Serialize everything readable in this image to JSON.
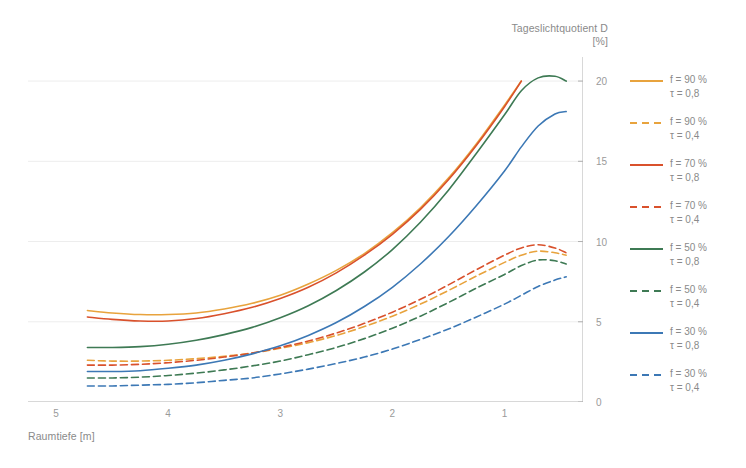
{
  "chart_data": {
    "type": "line",
    "title": "Tageslichtquotient D",
    "title_unit": "[%]",
    "xlabel": "Raumtiefe [m]",
    "ylabel": "Tageslichtquotient D [%]",
    "xlim": [
      5.25,
      0.3
    ],
    "ylim": [
      0,
      21.5
    ],
    "x_reversed": true,
    "xticks_major": [
      5,
      4,
      3,
      2,
      1
    ],
    "xtick_labels": [
      "5",
      "4",
      "3",
      "2",
      "1"
    ],
    "xticks_minor": [
      4.5,
      3.5,
      2.5,
      1.5,
      0.5
    ],
    "yticks": [
      0,
      5,
      10,
      15,
      20
    ],
    "ytick_labels": [
      "0",
      "5",
      "10",
      "15",
      "20"
    ],
    "grid": "horizontal",
    "legend_position": "right",
    "x": [
      4.72,
      4.5,
      4.25,
      4.0,
      3.75,
      3.5,
      3.25,
      3.0,
      2.75,
      2.5,
      2.25,
      2.0,
      1.75,
      1.5,
      1.25,
      1.0,
      0.85,
      0.7,
      0.55,
      0.45
    ],
    "series": [
      {
        "name": "f = 90 % / τ = 0,8",
        "label_line1": "f = 90 %",
        "label_line2": "τ = 0,8",
        "color": "#E8A33D",
        "style": "solid",
        "values": [
          5.7,
          5.55,
          5.45,
          5.45,
          5.55,
          5.8,
          6.15,
          6.65,
          7.35,
          8.2,
          9.25,
          10.55,
          12.1,
          13.95,
          16.1,
          18.5,
          20.0,
          null,
          null,
          null
        ]
      },
      {
        "name": "f = 90 % / τ = 0,4",
        "label_line1": "f = 90 %",
        "label_line2": "τ = 0,4",
        "color": "#E8A33D",
        "style": "dashed",
        "values": [
          2.6,
          2.55,
          2.55,
          2.6,
          2.7,
          2.85,
          3.05,
          3.35,
          3.7,
          4.15,
          4.7,
          5.35,
          6.1,
          6.95,
          7.85,
          8.7,
          9.15,
          9.4,
          9.3,
          9.15
        ]
      },
      {
        "name": "f = 70 % / τ = 0,8",
        "label_line1": "f = 70 %",
        "label_line2": "τ = 0,8",
        "color": "#D9512C",
        "style": "solid",
        "values": [
          5.3,
          5.15,
          5.05,
          5.05,
          5.2,
          5.5,
          5.9,
          6.45,
          7.15,
          8.05,
          9.15,
          10.45,
          12.0,
          13.85,
          16.0,
          18.4,
          20.0,
          null,
          null,
          null
        ]
      },
      {
        "name": "f = 70 % / τ = 0,4",
        "label_line1": "f = 70 %",
        "label_line2": "τ = 0,4",
        "color": "#D9512C",
        "style": "dashed",
        "values": [
          2.3,
          2.3,
          2.35,
          2.45,
          2.6,
          2.8,
          3.05,
          3.4,
          3.8,
          4.3,
          4.9,
          5.6,
          6.4,
          7.3,
          8.25,
          9.15,
          9.6,
          9.8,
          9.6,
          9.3
        ]
      },
      {
        "name": "f = 50 % / τ = 0,8",
        "label_line1": "f = 50 %",
        "label_line2": "τ = 0,8",
        "color": "#3E7A54",
        "style": "solid",
        "values": [
          3.4,
          3.4,
          3.45,
          3.6,
          3.85,
          4.2,
          4.65,
          5.25,
          6.0,
          6.95,
          8.1,
          9.5,
          11.2,
          13.2,
          15.5,
          17.9,
          19.4,
          20.2,
          20.3,
          20.0
        ]
      },
      {
        "name": "f = 50 % / τ = 0,4",
        "label_line1": "f = 50 %",
        "label_line2": "τ = 0,4",
        "color": "#3E7A54",
        "style": "dashed",
        "values": [
          1.5,
          1.5,
          1.55,
          1.65,
          1.8,
          2.0,
          2.25,
          2.55,
          2.95,
          3.4,
          3.95,
          4.6,
          5.35,
          6.2,
          7.1,
          7.95,
          8.5,
          8.85,
          8.8,
          8.6
        ]
      },
      {
        "name": "f = 30 % / τ = 0,8",
        "label_line1": "f = 30 %",
        "label_line2": "τ = 0,8",
        "color": "#3C78B5",
        "style": "solid",
        "values": [
          1.9,
          1.9,
          1.95,
          2.1,
          2.3,
          2.6,
          3.0,
          3.5,
          4.15,
          4.95,
          5.95,
          7.15,
          8.6,
          10.3,
          12.25,
          14.4,
          15.9,
          17.2,
          17.95,
          18.1
        ]
      },
      {
        "name": "f = 30 % / τ = 0,4",
        "label_line1": "f = 30 %",
        "label_line2": "τ = 0,4",
        "color": "#3C78B5",
        "style": "dashed",
        "values": [
          1.0,
          1.0,
          1.05,
          1.1,
          1.2,
          1.35,
          1.5,
          1.75,
          2.05,
          2.4,
          2.8,
          3.3,
          3.9,
          4.55,
          5.3,
          6.1,
          6.65,
          7.2,
          7.6,
          7.8
        ]
      }
    ]
  },
  "legend": {
    "items": [
      {
        "line1": "f = 90 %",
        "line2": "τ = 0,8",
        "color": "#E8A33D",
        "style": "solid"
      },
      {
        "line1": "f = 90 %",
        "line2": "τ = 0,4",
        "color": "#E8A33D",
        "style": "dashed"
      },
      {
        "line1": "f = 70 %",
        "line2": "τ = 0,8",
        "color": "#D9512C",
        "style": "solid"
      },
      {
        "line1": "f = 70 %",
        "line2": "τ = 0,4",
        "color": "#D9512C",
        "style": "dashed"
      },
      {
        "line1": "f = 50 %",
        "line2": "τ = 0,8",
        "color": "#3E7A54",
        "style": "solid"
      },
      {
        "line1": "f = 50 %",
        "line2": "τ = 0,4",
        "color": "#3E7A54",
        "style": "dashed"
      },
      {
        "line1": "f = 30 %",
        "line2": "τ = 0,8",
        "color": "#3C78B5",
        "style": "solid"
      },
      {
        "line1": "f = 30 %",
        "line2": "τ = 0,4",
        "color": "#3C78B5",
        "style": "dashed"
      }
    ]
  },
  "colors": {
    "gold": "#E8A33D",
    "red": "#D9512C",
    "green": "#3E7A54",
    "blue": "#3C78B5",
    "axis": "#b0b0b0",
    "grid": "#ededed",
    "text": "#8a8a8a"
  }
}
